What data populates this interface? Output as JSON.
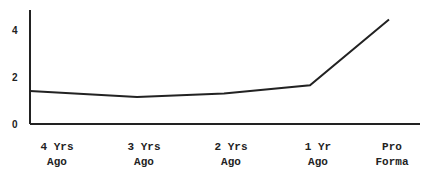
{
  "chart_data": {
    "type": "line",
    "title": "",
    "xlabel": "",
    "ylabel": "",
    "categories": [
      [
        "4 Yrs",
        "Ago"
      ],
      [
        "3 Yrs",
        "Ago"
      ],
      [
        "2 Yrs",
        "Ago"
      ],
      [
        "1 Yr",
        "Ago"
      ],
      [
        "Pro",
        "Forma"
      ]
    ],
    "values": [
      1.4,
      1.15,
      1.3,
      1.65,
      4.45
    ],
    "ylim": [
      0,
      5
    ],
    "yticks": [
      "0",
      "2",
      "4"
    ],
    "grid": false,
    "legend": null,
    "line_color": "#222222"
  }
}
